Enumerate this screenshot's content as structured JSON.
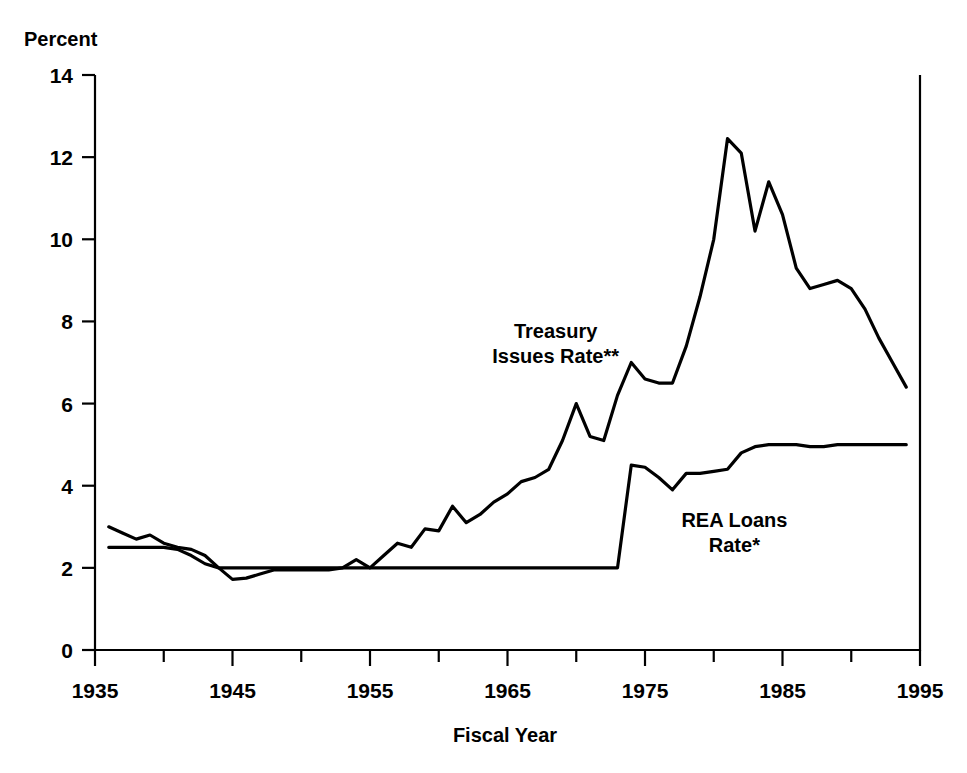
{
  "chart_data": {
    "type": "line",
    "title": "",
    "axis_label_top": "Percent",
    "xlabel": "Fiscal Year",
    "ylabel": "Percent",
    "xlim": [
      1935,
      1995
    ],
    "ylim": [
      0,
      14
    ],
    "ytick_step": 2,
    "xtick_step": 10,
    "x_minor_step": 5,
    "grid": false,
    "legend_position": "inline-annotations",
    "line_color": "#000000",
    "background_color": "#ffffff",
    "yticks": [
      "0",
      "2",
      "4",
      "6",
      "8",
      "10",
      "12",
      "14"
    ],
    "ytick_values": [
      0,
      2,
      4,
      6,
      8,
      10,
      12,
      14
    ],
    "xticks": [
      "1935",
      "1945",
      "1955",
      "1965",
      "1975",
      "1985",
      "1995"
    ],
    "xtick_values": [
      1935,
      1945,
      1955,
      1965,
      1975,
      1985,
      1995
    ],
    "x_minor_values": [
      1940,
      1950,
      1960,
      1970,
      1980,
      1990
    ],
    "annotations": [
      {
        "name": "treasury-label",
        "text": "Treasury\nIssues Rate**",
        "line1": "Treasury",
        "line2": "Issues Rate**",
        "x": 1968.5,
        "y": 7.6
      },
      {
        "name": "rea-label",
        "text": "REA Loans\nRate*",
        "line1": "REA Loans",
        "line2": "Rate*",
        "x": 1981.5,
        "y": 3.0
      }
    ],
    "series": [
      {
        "name": "Treasury Issues Rate**",
        "label": "Treasury Issues Rate**",
        "x": [
          1936,
          1937,
          1938,
          1939,
          1940,
          1941,
          1942,
          1943,
          1944,
          1945,
          1946,
          1947,
          1948,
          1949,
          1950,
          1951,
          1952,
          1953,
          1954,
          1955,
          1956,
          1957,
          1958,
          1959,
          1960,
          1961,
          1962,
          1963,
          1964,
          1965,
          1966,
          1967,
          1968,
          1969,
          1970,
          1971,
          1972,
          1973,
          1974,
          1975,
          1976,
          1977,
          1978,
          1979,
          1980,
          1981,
          1982,
          1983,
          1984,
          1985,
          1986,
          1987,
          1988,
          1989,
          1990,
          1991,
          1992,
          1993,
          1994
        ],
        "values": [
          3.0,
          2.85,
          2.7,
          2.8,
          2.6,
          2.5,
          2.45,
          2.3,
          2.0,
          1.72,
          1.75,
          1.85,
          1.95,
          1.95,
          1.95,
          1.95,
          1.95,
          2.0,
          2.2,
          2.0,
          2.3,
          2.6,
          2.5,
          2.95,
          2.9,
          3.5,
          3.1,
          3.3,
          3.6,
          3.8,
          4.1,
          4.2,
          4.4,
          5.1,
          6.0,
          5.2,
          5.1,
          6.2,
          7.0,
          6.6,
          6.5,
          6.5,
          7.4,
          8.6,
          10.0,
          12.45,
          12.1,
          10.2,
          11.4,
          10.6,
          9.3,
          8.8,
          8.9,
          9.0,
          8.8,
          8.3,
          7.6,
          7.0,
          6.4
        ]
      },
      {
        "name": "REA Loans Rate*",
        "label": "REA Loans Rate*",
        "x": [
          1936,
          1937,
          1938,
          1939,
          1940,
          1941,
          1942,
          1943,
          1944,
          1945,
          1946,
          1947,
          1948,
          1949,
          1950,
          1951,
          1952,
          1953,
          1954,
          1955,
          1956,
          1957,
          1958,
          1959,
          1960,
          1961,
          1962,
          1963,
          1964,
          1965,
          1966,
          1967,
          1968,
          1969,
          1970,
          1971,
          1972,
          1973,
          1974,
          1975,
          1976,
          1977,
          1978,
          1979,
          1980,
          1981,
          1982,
          1983,
          1984,
          1985,
          1986,
          1987,
          1988,
          1989,
          1990,
          1991,
          1992,
          1993,
          1994
        ],
        "values": [
          2.5,
          2.5,
          2.5,
          2.5,
          2.5,
          2.45,
          2.3,
          2.1,
          2.0,
          2.0,
          2.0,
          2.0,
          2.0,
          2.0,
          2.0,
          2.0,
          2.0,
          2.0,
          2.0,
          2.0,
          2.0,
          2.0,
          2.0,
          2.0,
          2.0,
          2.0,
          2.0,
          2.0,
          2.0,
          2.0,
          2.0,
          2.0,
          2.0,
          2.0,
          2.0,
          2.0,
          2.0,
          2.0,
          4.5,
          4.45,
          4.2,
          3.9,
          4.3,
          4.3,
          4.35,
          4.4,
          4.8,
          4.95,
          5.0,
          5.0,
          5.0,
          4.95,
          4.95,
          5.0,
          5.0,
          5.0,
          5.0,
          5.0,
          5.0
        ]
      }
    ]
  }
}
